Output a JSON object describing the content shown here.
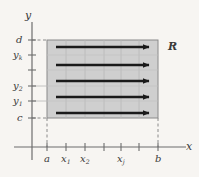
{
  "figure": {
    "background_color": "#f7f5f2",
    "axes": {
      "x_axis_label": "x",
      "y_axis_label": "y",
      "axis_color": "#6d6d6d"
    },
    "region": {
      "label": "R",
      "fill_color": "#cfcfcf",
      "border_color": "#8a8a8a",
      "x_from_label": "a",
      "x_to_label": "b",
      "y_from_label": "c",
      "y_to_label": "d"
    },
    "x_ticks": [
      {
        "label_main": "a",
        "label_sub": ""
      },
      {
        "label_main": "x",
        "label_sub": "1"
      },
      {
        "label_main": "x",
        "label_sub": "2"
      },
      {
        "label_main": "x",
        "label_sub": "j"
      },
      {
        "label_main": "b",
        "label_sub": ""
      }
    ],
    "y_ticks": [
      {
        "label_main": "d",
        "label_sub": ""
      },
      {
        "label_main": "y",
        "label_sub": "k"
      },
      {
        "label_main": "y",
        "label_sub": "2"
      },
      {
        "label_main": "y",
        "label_sub": "1"
      },
      {
        "label_main": "c",
        "label_sub": ""
      }
    ],
    "arrows": {
      "count": 5,
      "direction": "right",
      "color": "#1a1a1a"
    },
    "dashed_guides": {
      "color": "#8a8a8a",
      "horizontal_at": [
        "d",
        "c"
      ],
      "vertical_at": [
        "a",
        "b"
      ]
    }
  }
}
